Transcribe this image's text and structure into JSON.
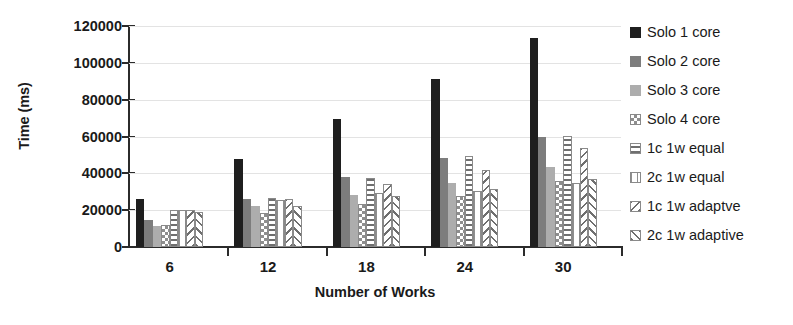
{
  "chart_data": {
    "type": "bar",
    "title": "",
    "subtitle": "",
    "xlabel": "Number of Works",
    "ylabel": "Time (ms)",
    "categories": [
      "6",
      "12",
      "18",
      "24",
      "30"
    ],
    "ylim": [
      0,
      120000
    ],
    "ytick_labels": [
      "0",
      "20000",
      "40000",
      "60000",
      "80000",
      "100000",
      "120000"
    ],
    "ytick_values": [
      0,
      20000,
      40000,
      60000,
      80000,
      100000,
      120000
    ],
    "grid": true,
    "grid_axis": "y",
    "legend_position": "right",
    "orientation": "vertical",
    "series": [
      {
        "name": "Solo 1 core",
        "pattern": "solid-black",
        "color": "#1f1f1f",
        "values": [
          26000,
          48000,
          69500,
          91500,
          113500
        ]
      },
      {
        "name": "Solo 2 core",
        "pattern": "solid-dark-gray",
        "color": "#7d7d7d",
        "values": [
          14500,
          26000,
          38000,
          48500,
          60000
        ]
      },
      {
        "name": "Solo 3 core",
        "pattern": "solid-light-gray",
        "color": "#adadad",
        "values": [
          11500,
          22000,
          28000,
          35000,
          43500
        ]
      },
      {
        "name": "Solo 4 core",
        "pattern": "checkerboard",
        "color": "#8e8e8e",
        "values": [
          12000,
          18500,
          23500,
          27500,
          36000
        ]
      },
      {
        "name": "1c 1w equal",
        "pattern": "horizontal-lines",
        "color": "#6f6f6f",
        "values": [
          20000,
          26500,
          37500,
          49500,
          60500
        ]
      },
      {
        "name": "2c 1w equal",
        "pattern": "vertical-lines",
        "color": "#8f8f8f",
        "values": [
          20000,
          25500,
          29500,
          30500,
          34500
        ]
      },
      {
        "name": "1c 1w adaptve",
        "pattern": "diagonal-lines",
        "color": "#6f6f6f",
        "values": [
          20000,
          26000,
          34000,
          42000,
          53500
        ]
      },
      {
        "name": "2c 1w adaptive",
        "pattern": "crosshatch-chevron",
        "color": "#6f6f6f",
        "values": [
          19000,
          22500,
          27500,
          31500,
          37000
        ]
      }
    ]
  },
  "axes": {
    "y_title": "Time (ms)",
    "x_title": "Number of Works"
  },
  "colors": {
    "axis": "#2b2b2b",
    "grid": "#e3e3e3",
    "background": "#ffffff",
    "text": "#1a1a1a"
  }
}
